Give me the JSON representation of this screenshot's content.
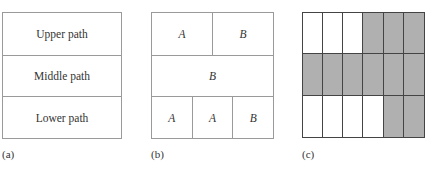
{
  "panel_a": {
    "caption": "(a)",
    "rows": [
      "Upper path",
      "Middle path",
      "Lower path"
    ]
  },
  "panel_b": {
    "caption": "(b)",
    "rows": [
      [
        "A",
        "B"
      ],
      [
        "B"
      ],
      [
        "A",
        "A",
        "B"
      ]
    ]
  },
  "panel_c": {
    "caption": "(c)",
    "columns": 6,
    "rows": 3,
    "shaded_color": "#b0b0b0",
    "empty_color": "#ffffff",
    "grid": [
      [
        0,
        0,
        0,
        1,
        1,
        1
      ],
      [
        1,
        1,
        1,
        1,
        1,
        1
      ],
      [
        0,
        0,
        0,
        0,
        1,
        1
      ]
    ]
  }
}
